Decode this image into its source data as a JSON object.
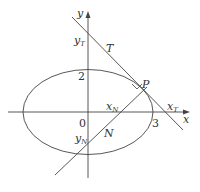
{
  "diagram": {
    "colors": {
      "line": "#444444",
      "text": "#333333",
      "background": "#ffffff"
    },
    "axes": {
      "x_label": "x",
      "y_label": "y",
      "origin_label": "0"
    },
    "ticks": {
      "x_tick": "3",
      "y_tick": "2"
    },
    "labels": {
      "tangent": "T",
      "normal": "N",
      "point": "P",
      "y_T": "y",
      "y_T_sub": "T",
      "x_T": "x",
      "x_T_sub": "T",
      "x_N": "x",
      "x_N_sub": "N",
      "y_N": "y",
      "y_N_sub": "N"
    }
  }
}
